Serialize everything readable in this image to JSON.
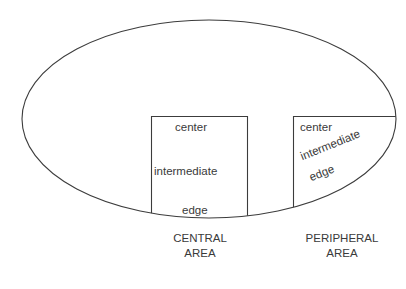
{
  "diagram": {
    "stroke_color": "#3c3c3c",
    "text_color": "#3a3a3a",
    "background": "#ffffff",
    "central_box": {
      "labels": {
        "center": "center",
        "intermediate": "intermediate",
        "edge": "edge"
      },
      "caption_line1": "CENTRAL",
      "caption_line2": "AREA"
    },
    "peripheral_box": {
      "labels": {
        "center": "center",
        "intermediate": "intermediate",
        "edge": "edge"
      },
      "caption_line1": "PERIPHERAL",
      "caption_line2": "AREA"
    }
  }
}
